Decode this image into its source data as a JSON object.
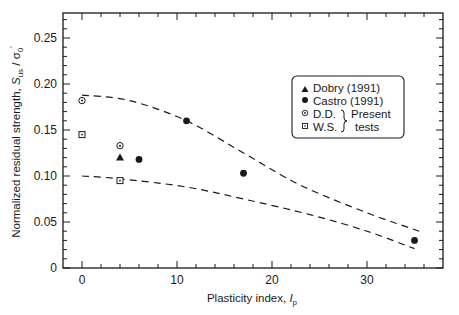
{
  "chart_data": {
    "type": "scatter",
    "title": "",
    "xlabel": "Plasticity index, I_p",
    "xlabel_main": "Plasticity index, ",
    "xlabel_var": "I",
    "xlabel_sub": "p",
    "ylabel": "Normalized residual strength, S_us / σ'_0",
    "ylabel_main": "Normalized residual strength, ",
    "ylabel_var": "S",
    "ylabel_sub": "us",
    "ylabel_slash": " / σ",
    "ylabel_sub2": "0",
    "ylabel_prime": "′",
    "xlim": [
      -3.5,
      37
    ],
    "ylim": [
      0,
      0.275
    ],
    "xticks": [
      0,
      10,
      20,
      30
    ],
    "xtick_labels": [
      "0",
      "10",
      "20",
      "30"
    ],
    "yticks": [
      0,
      0.05,
      0.1,
      0.15,
      0.2,
      0.25
    ],
    "ytick_labels": [
      "0",
      "0.05",
      "0.10",
      "0.15",
      "0.20",
      "0.25"
    ],
    "grid": false,
    "legend_position": "upper right (inside)",
    "series": [
      {
        "name": "Dobry (1991)",
        "marker": "filled-triangle",
        "points": [
          [
            4,
            0.12
          ]
        ]
      },
      {
        "name": "Castro (1991)",
        "marker": "filled-circle",
        "points": [
          [
            6,
            0.118
          ],
          [
            11,
            0.16
          ],
          [
            17,
            0.103
          ],
          [
            35,
            0.03
          ]
        ]
      },
      {
        "name": "D.D. (Present tests)",
        "marker": "open-circle-dot",
        "points": [
          [
            0,
            0.182
          ],
          [
            4,
            0.133
          ]
        ]
      },
      {
        "name": "W.S. (Present tests)",
        "marker": "open-square-dot",
        "points": [
          [
            0,
            0.145
          ],
          [
            4,
            0.095
          ]
        ]
      }
    ],
    "bounds": [
      {
        "name": "upper bound",
        "style": "dashed",
        "points": [
          [
            0,
            0.188
          ],
          [
            5,
            0.182
          ],
          [
            11,
            0.16
          ],
          [
            17,
            0.125
          ],
          [
            23,
            0.09
          ],
          [
            30,
            0.06
          ],
          [
            35.5,
            0.04
          ]
        ]
      },
      {
        "name": "lower bound",
        "style": "dashed",
        "points": [
          [
            0,
            0.1
          ],
          [
            4,
            0.097
          ],
          [
            11,
            0.088
          ],
          [
            17,
            0.075
          ],
          [
            24,
            0.058
          ],
          [
            30,
            0.04
          ],
          [
            35,
            0.021
          ]
        ]
      }
    ],
    "legend": {
      "entries": [
        "Dobry (1991)",
        "Castro (1991)",
        "D.D.",
        "W.S."
      ],
      "group_label_line1": "Present",
      "group_label_line2": "tests"
    }
  }
}
